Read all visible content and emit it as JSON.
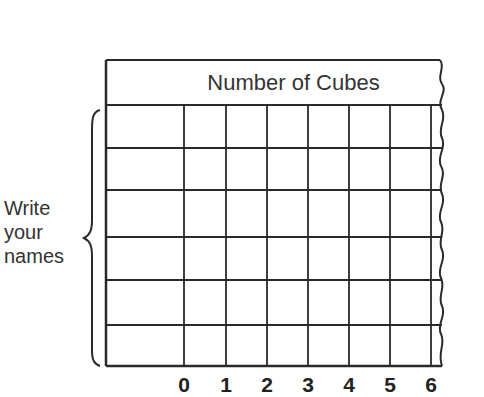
{
  "table": {
    "header": "Number of Cubes",
    "row_label": [
      "Write",
      "your",
      "names"
    ],
    "rows": 6,
    "columns": 7,
    "axis_ticks": [
      "0",
      "1",
      "2",
      "3",
      "4",
      "5",
      "6"
    ]
  }
}
